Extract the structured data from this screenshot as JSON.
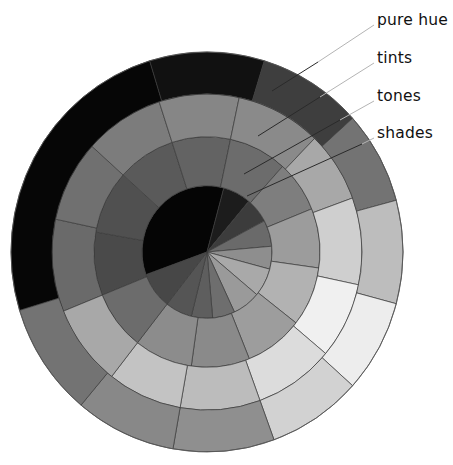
{
  "diagram": {
    "center": {
      "x": 207,
      "y": 252
    },
    "scale_y": 1.02,
    "ring_edges": [
      0,
      65,
      113,
      155,
      196
    ],
    "rings": [
      {
        "name": "shades",
        "r_inner": 0,
        "r_outer": 65,
        "sectors": [
          {
            "start": 160,
            "end": 285,
            "fill": "#050505"
          },
          {
            "start": -75,
            "end": -50,
            "fill": "#1c1c1c"
          },
          {
            "start": -50,
            "end": -28,
            "fill": "#3c3c3c"
          },
          {
            "start": -28,
            "end": -5,
            "fill": "#6a6a6a"
          },
          {
            "start": -5,
            "end": 15,
            "fill": "#8e8e8e"
          },
          {
            "start": 15,
            "end": 40,
            "fill": "#a9a9a9"
          },
          {
            "start": 40,
            "end": 65,
            "fill": "#9a9a9a"
          },
          {
            "start": 65,
            "end": 85,
            "fill": "#6e6e6e"
          },
          {
            "start": 85,
            "end": 104,
            "fill": "#5e5e5e"
          },
          {
            "start": 104,
            "end": 128,
            "fill": "#555555"
          },
          {
            "start": 128,
            "end": 160,
            "fill": "#474747"
          }
        ]
      },
      {
        "name": "tones",
        "r_inner": 65,
        "r_outer": 113,
        "sectors": [
          {
            "start": 158,
            "end": 190,
            "fill": "#4a4a4a"
          },
          {
            "start": 190,
            "end": 222,
            "fill": "#505050"
          },
          {
            "start": 222,
            "end": 252,
            "fill": "#5a5a5a"
          },
          {
            "start": 252,
            "end": 282,
            "fill": "#636363"
          },
          {
            "start": -78,
            "end": -48,
            "fill": "#6c6c6c"
          },
          {
            "start": -48,
            "end": -22,
            "fill": "#7e7e7e"
          },
          {
            "start": -22,
            "end": 8,
            "fill": "#9c9c9c"
          },
          {
            "start": 8,
            "end": 38,
            "fill": "#b2b2b2"
          },
          {
            "start": 38,
            "end": 68,
            "fill": "#9d9d9d"
          },
          {
            "start": 68,
            "end": 98,
            "fill": "#8a8a8a"
          },
          {
            "start": 98,
            "end": 128,
            "fill": "#8c8c8c"
          },
          {
            "start": 128,
            "end": 158,
            "fill": "#6c6c6c"
          }
        ]
      },
      {
        "name": "tints",
        "r_inner": 113,
        "r_outer": 155,
        "sectors": [
          {
            "start": 158,
            "end": 192,
            "fill": "#6a6a6a"
          },
          {
            "start": 192,
            "end": 222,
            "fill": "#707070"
          },
          {
            "start": 222,
            "end": 252,
            "fill": "#7c7c7c"
          },
          {
            "start": 252,
            "end": 282,
            "fill": "#868686"
          },
          {
            "start": -78,
            "end": -46,
            "fill": "#8a8a8a"
          },
          {
            "start": -46,
            "end": -20,
            "fill": "#a8a8a8"
          },
          {
            "start": -20,
            "end": 12,
            "fill": "#cfcfcf"
          },
          {
            "start": 12,
            "end": 40,
            "fill": "#f0f0f0"
          },
          {
            "start": 40,
            "end": 70,
            "fill": "#dcdcdc"
          },
          {
            "start": 70,
            "end": 100,
            "fill": "#bcbcbc"
          },
          {
            "start": 100,
            "end": 128,
            "fill": "#c3c3c3"
          },
          {
            "start": 128,
            "end": 158,
            "fill": "#a8a8a8"
          }
        ]
      },
      {
        "name": "pure hue",
        "r_inner": 155,
        "r_outer": 196,
        "sectors": [
          {
            "start": 163,
            "end": 253,
            "fill": "#060606"
          },
          {
            "start": 253,
            "end": 287,
            "fill": "#111111"
          },
          {
            "start": -73,
            "end": -42,
            "fill": "#3e3e3e"
          },
          {
            "start": -42,
            "end": -15,
            "fill": "#737373"
          },
          {
            "start": -15,
            "end": 15,
            "fill": "#bdbdbd"
          },
          {
            "start": 15,
            "end": 42,
            "fill": "#ededed"
          },
          {
            "start": 42,
            "end": 70,
            "fill": "#d2d2d2"
          },
          {
            "start": 70,
            "end": 100,
            "fill": "#8f8f8f"
          },
          {
            "start": 100,
            "end": 130,
            "fill": "#888888"
          },
          {
            "start": 130,
            "end": 163,
            "fill": "#737373"
          }
        ]
      }
    ],
    "labels": [
      {
        "id": "pure-hue",
        "text": "pure hue",
        "y": 13,
        "line": {
          "x1": 374,
          "y1": 25,
          "xm": 318,
          "ym": 62,
          "x2": 272,
          "y2": 91
        }
      },
      {
        "id": "tints",
        "text": "tints",
        "y": 51,
        "line": {
          "x1": 374,
          "y1": 63,
          "xm": 320,
          "ym": 97,
          "x2": 258,
          "y2": 136
        }
      },
      {
        "id": "tones",
        "text": "tones",
        "y": 89,
        "line": {
          "x1": 374,
          "y1": 101,
          "xm": 340,
          "ym": 120,
          "x2": 244,
          "y2": 174
        }
      },
      {
        "id": "shades",
        "text": "shades",
        "y": 126,
        "line": {
          "x1": 374,
          "y1": 138,
          "xm": 362,
          "ym": 144,
          "x2": 247,
          "y2": 196
        }
      }
    ]
  }
}
